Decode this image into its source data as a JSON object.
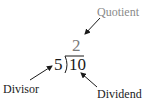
{
  "diagram": {
    "quotient": {
      "label": "Quotient",
      "value": "2"
    },
    "divisor": {
      "label": "Divisor",
      "value": "5"
    },
    "dividend": {
      "label": "Dividend",
      "value": "10"
    },
    "colors": {
      "quotient": "#7a7a7a",
      "text": "#1a1a1a",
      "arrow": "#1a1a1a",
      "background": "#ffffff"
    }
  }
}
